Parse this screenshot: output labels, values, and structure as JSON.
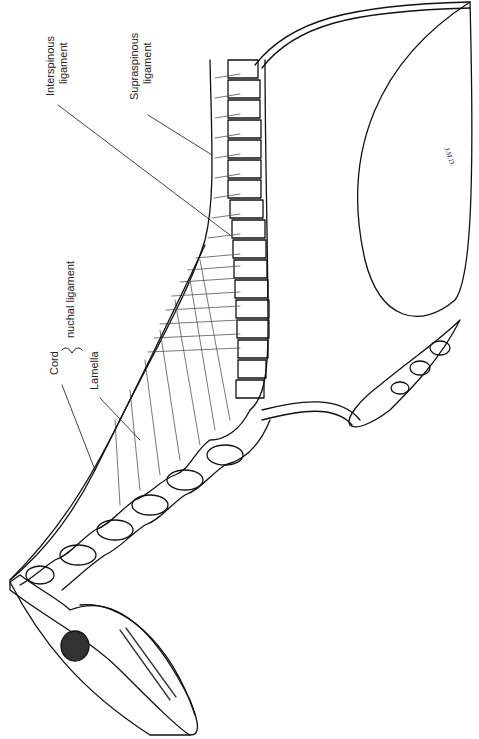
{
  "figure": {
    "labels": {
      "interspinous": [
        "Interspinous",
        "ligament"
      ],
      "supraspinous": [
        "Supraspinous",
        "ligament"
      ],
      "nuchal": "nuchal ligament",
      "cord": "Cord",
      "lamella": "Lamella"
    },
    "signature": "J.M.D.",
    "colors": {
      "line": "#111111",
      "background": "#ffffff",
      "hatch": "#555555"
    }
  }
}
